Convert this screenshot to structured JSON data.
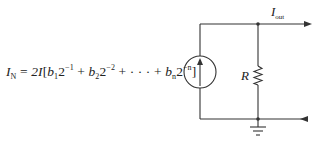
{
  "formula": {
    "lhs_symbol": "I",
    "lhs_subscript": "N",
    "equals": "=",
    "coefficient": "2I",
    "open_bracket": "[",
    "terms": [
      {
        "bit": "b",
        "bit_sub": "1",
        "base": "2",
        "exp": "−1"
      },
      {
        "bit": "b",
        "bit_sub": "2",
        "base": "2",
        "exp": "−2"
      },
      {
        "bit": "b",
        "bit_sub": "n",
        "base": "2",
        "exp": "−n"
      }
    ],
    "plus": "+",
    "ellipsis": "· · ·",
    "close_bracket": "]"
  },
  "labels": {
    "resistor": "R",
    "output_current_symbol": "I",
    "output_current_subscript": "out"
  },
  "colors": {
    "line": "#333333",
    "text": "#222222",
    "background": "#ffffff"
  }
}
